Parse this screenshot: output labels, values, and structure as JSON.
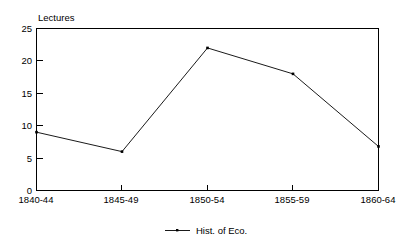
{
  "chart_data": {
    "type": "line",
    "title": "",
    "ylabel": "Lectures",
    "xlabel": "",
    "categories": [
      "1840-44",
      "1845-49",
      "1850-54",
      "1855-59",
      "1860-64"
    ],
    "series": [
      {
        "name": "Hist. of Eco.",
        "values": [
          9,
          6,
          22,
          18,
          6.8
        ]
      }
    ],
    "ylim": [
      0,
      25
    ],
    "yticks": [
      0,
      5,
      10,
      15,
      20,
      25
    ],
    "ytick_labels": [
      "0",
      "5",
      "10",
      "15",
      "20",
      "25"
    ],
    "grid": false,
    "legend_position": "bottom",
    "marker": "point",
    "line_color": "#000000",
    "background_color": "#ffffff",
    "frame": "box"
  },
  "legend": {
    "entries": [
      {
        "label": "Hist. of Eco."
      }
    ]
  }
}
